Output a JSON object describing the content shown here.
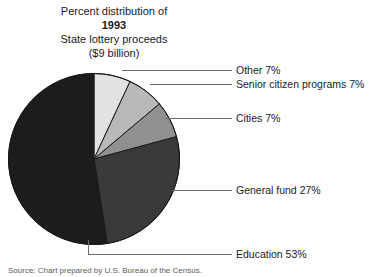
{
  "title": {
    "line1": "Percent distribution of",
    "line2": "1993",
    "line3": "State lottery proceeds",
    "line4": "($9 billion)"
  },
  "source": {
    "text": "Source: Chart prepared by U.S. Bureau of the Census."
  },
  "chart_data": {
    "type": "pie",
    "title": "Percent distribution of 1993 State lottery proceeds ($9 billion)",
    "units": "percent",
    "total_label": "$9 billion",
    "year": "1993",
    "start_angle_deg": 0,
    "direction": "clockwise",
    "legend_position": "right-leader-labels",
    "grid": false,
    "categories": [
      "Other",
      "Senior citizen programs",
      "Cities",
      "General fund",
      "Education"
    ],
    "values": [
      7,
      7,
      7,
      27,
      53
    ],
    "colors": [
      "#e2e2e2",
      "#b9b9b9",
      "#909090",
      "#3a3a3a",
      "#1c1c1c"
    ],
    "slices": [
      {
        "label": "Other 7%",
        "name": "Other",
        "value": 7,
        "color": "#e2e2e2"
      },
      {
        "label": "Senior citizen programs 7%",
        "name": "Senior citizen programs",
        "value": 7,
        "color": "#b9b9b9"
      },
      {
        "label": "Cities 7%",
        "name": "Cities",
        "value": 7,
        "color": "#909090"
      },
      {
        "label": "General fund 27%",
        "name": "General fund",
        "value": 27,
        "color": "#3a3a3a"
      },
      {
        "label": "Education 53%",
        "name": "Education",
        "value": 53,
        "color": "#1c1c1c"
      }
    ]
  }
}
